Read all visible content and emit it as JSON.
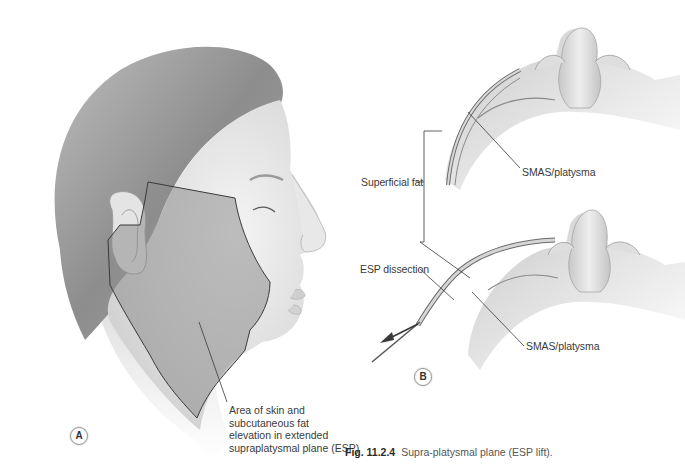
{
  "figure": {
    "caption_number": "Fig. 11.2.4",
    "caption_text": "Supra-platysmal plane (ESP lift).",
    "panels": [
      {
        "id": "A",
        "badge": "A",
        "description": "Lateral view of female face with outlined dissection area",
        "labels": {
          "area_line1": "Area of skin and",
          "area_line2": "subcutaneous fat",
          "area_line3": "elevation in extended",
          "area_line4": "supraplatysmal plane (ESP)"
        }
      },
      {
        "id": "B",
        "badge": "B",
        "description": "Inferior view cross-sections showing tissue layers before and during dissection",
        "labels": {
          "superficial_fat": "Superficial fat",
          "smas_top": "SMAS/platysma",
          "esp_dissection": "ESP dissection",
          "smas_bottom": "SMAS/platysma"
        }
      }
    ]
  },
  "colors": {
    "background": "#ffffff",
    "skin": "#e6e6e6",
    "shaded_area": "#9c9c9c",
    "outline": "#3a3a3a",
    "hair": "#8a8a8a",
    "label_text": "#3a3a3a"
  }
}
